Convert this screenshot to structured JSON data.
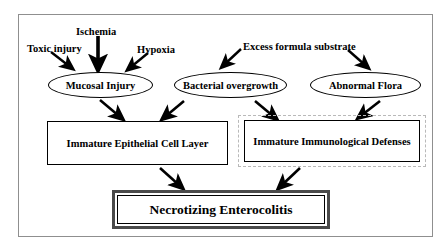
{
  "diagram": {
    "frame_color": "#8f8f8f",
    "inputs": [
      {
        "id": "toxic-injury",
        "label": "Toxic injury",
        "x": 27,
        "y": 44,
        "size": 10.5
      },
      {
        "id": "ischemia",
        "label": "Ischemia",
        "x": 76,
        "y": 27,
        "size": 10.5
      },
      {
        "id": "hypoxia",
        "label": "Hypoxia",
        "x": 137,
        "y": 45,
        "size": 10.5
      },
      {
        "id": "excess-formula-substrate",
        "label": "Excess formula substrate",
        "x": 243,
        "y": 42,
        "size": 10.5
      }
    ],
    "ellipses": [
      {
        "id": "mucosal-injury",
        "label": "Mucosal Injury",
        "x": 48,
        "y": 72,
        "w": 105,
        "h": 26,
        "size": 10.5
      },
      {
        "id": "bacterial-overgrowth",
        "label": "Bacterial overgrowth",
        "x": 174,
        "y": 72,
        "w": 113,
        "h": 26,
        "size": 10.5
      },
      {
        "id": "abnormal-flora",
        "label": "Abnormal Flora",
        "x": 310,
        "y": 72,
        "w": 111,
        "h": 26,
        "size": 10.5
      }
    ],
    "boxes": [
      {
        "id": "immature-epithelial-cell-layer",
        "label": "Immature Epithelial Cell Layer",
        "x": 47,
        "y": 121,
        "w": 181,
        "h": 44,
        "size": 10.5
      },
      {
        "id": "immature-immunological-defenses",
        "label": "Immature Immunological Defenses",
        "x": 244,
        "y": 120,
        "w": 176,
        "h": 42,
        "size": 10.5
      }
    ],
    "outcome": {
      "id": "necrotizing-enterocolitis",
      "label": "Necrotizing Enterocolitis"
    },
    "arrows": [
      {
        "id": "toxic-injury-to-mucosal-injury",
        "x1": 51,
        "y1": 52,
        "x2": 71,
        "y2": 68
      },
      {
        "id": "ischemia-to-mucosal-injury",
        "x1": 98,
        "y1": 36,
        "x2": 98,
        "y2": 66
      },
      {
        "id": "hypoxia-to-mucosal-injury",
        "x1": 148,
        "y1": 53,
        "x2": 130,
        "y2": 68
      },
      {
        "id": "excess-substrate-to-bacterial-overgrowth",
        "x1": 241,
        "y1": 49,
        "x2": 224,
        "y2": 65
      },
      {
        "id": "excess-substrate-to-abnormal-flora",
        "x1": 348,
        "y1": 50,
        "x2": 366,
        "y2": 67
      },
      {
        "id": "mucosal-injury-to-epithelial-layer",
        "x1": 100,
        "y1": 100,
        "x2": 121,
        "y2": 118
      },
      {
        "id": "bacterial-overgrowth-to-epithelial-layer",
        "x1": 184,
        "y1": 101,
        "x2": 165,
        "y2": 118
      },
      {
        "id": "bacterial-overgrowth-to-immunological-defenses",
        "x1": 255,
        "y1": 101,
        "x2": 274,
        "y2": 118
      },
      {
        "id": "abnormal-flora-to-immunological-defenses",
        "x1": 380,
        "y1": 101,
        "x2": 361,
        "y2": 117
      },
      {
        "id": "epithelial-layer-to-necrotizing-enterocolitis",
        "x1": 160,
        "y1": 168,
        "x2": 180,
        "y2": 186
      },
      {
        "id": "immunological-defenses-to-necrotizing-enterocolitis",
        "x1": 300,
        "y1": 168,
        "x2": 281,
        "y2": 186
      }
    ]
  }
}
